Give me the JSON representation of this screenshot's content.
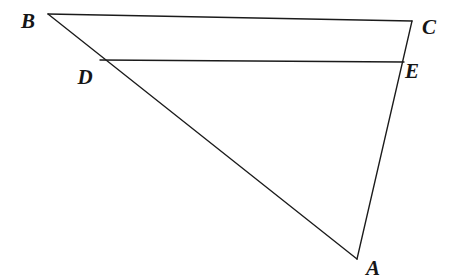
{
  "figure": {
    "background_color": "#ffffff",
    "line_color": "#1b1b1b",
    "label_color": "#161616",
    "canvas": {
      "width": 460,
      "height": 279
    },
    "points": [
      {
        "id": "B",
        "label": "B",
        "x": 48,
        "y": 14,
        "label_x": 28,
        "label_y": 21
      },
      {
        "id": "C",
        "label": "C",
        "x": 412,
        "y": 21,
        "label_x": 429,
        "label_y": 27
      },
      {
        "id": "D",
        "label": "D",
        "x": 100,
        "y": 60,
        "label_x": 85,
        "label_y": 77
      },
      {
        "id": "E",
        "label": "E",
        "x": 404,
        "y": 62,
        "label_x": 412,
        "label_y": 71
      },
      {
        "id": "A",
        "label": "A",
        "x": 357,
        "y": 259,
        "label_x": 373,
        "label_y": 268
      }
    ],
    "segments": [
      {
        "id": "BC",
        "from": "B",
        "to": "C",
        "name": "segment-bc"
      },
      {
        "id": "BA",
        "from": "B",
        "to": "A",
        "name": "segment-ba"
      },
      {
        "id": "CA",
        "from": "C",
        "to": "A",
        "name": "segment-ca"
      },
      {
        "id": "DE",
        "from": "D",
        "to": "E",
        "name": "segment-de"
      }
    ]
  }
}
